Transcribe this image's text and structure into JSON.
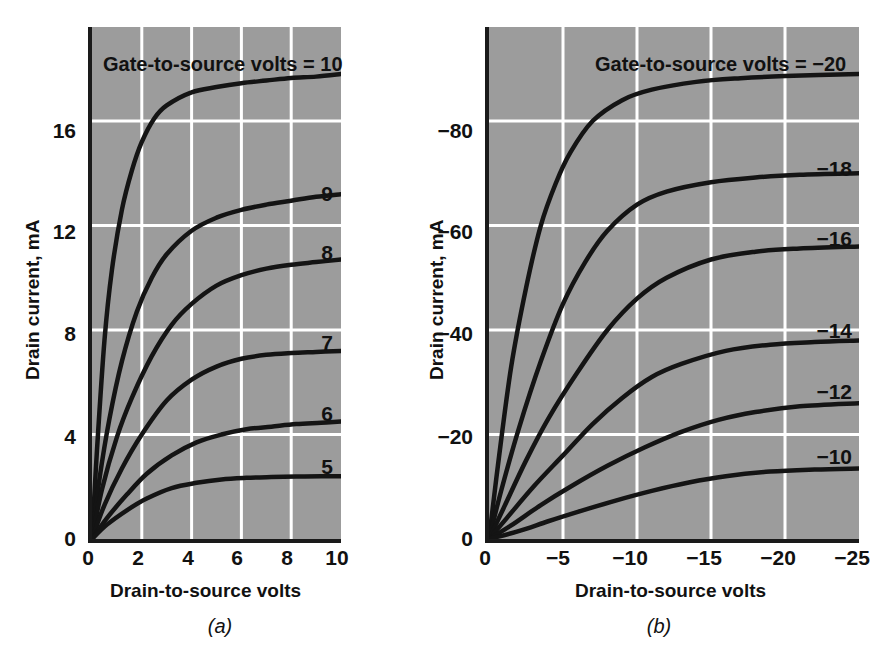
{
  "figure": {
    "background": "#ffffff",
    "plot_background": "#9c9c9c",
    "grid_color": "#ffffff",
    "curve_color": "#141414",
    "axis_color": "#1a1a1a"
  },
  "panel_a": {
    "caption": "(a)",
    "legend_title": "Gate-to-source volts = 10",
    "xlabel": "Drain-to-source volts",
    "ylabel": "Drain current, mA",
    "xticks": [
      "0",
      "2",
      "4",
      "6",
      "8",
      "10"
    ],
    "yticks": [
      "0",
      "4",
      "8",
      "12",
      "16"
    ],
    "curve_labels": [
      "9",
      "8",
      "7",
      "6",
      "5"
    ]
  },
  "panel_b": {
    "caption": "(b)",
    "legend_title": "Gate-to-source volts = −20",
    "xlabel": "Drain-to-source volts",
    "ylabel": "Drain current, mA",
    "xticks": [
      "0",
      "−5",
      "−10",
      "−15",
      "−20",
      "−25"
    ],
    "yticks": [
      "0",
      "−20",
      "−40",
      "−60",
      "−80"
    ],
    "curve_labels": [
      "−18",
      "−16",
      "−14",
      "−12",
      "−10"
    ]
  },
  "chart_data": [
    {
      "type": "line",
      "id": "panel-a",
      "title": "Gate-to-source volts = 10",
      "caption": "(a)",
      "xlabel": "Drain-to-source volts",
      "ylabel": "Drain current, mA",
      "xlim": [
        0,
        10
      ],
      "ylim": [
        0,
        19.6
      ],
      "xticks": [
        0,
        2,
        4,
        6,
        8,
        10
      ],
      "yticks": [
        0,
        4,
        8,
        12,
        16
      ],
      "grid": true,
      "legend_position": "inline-right-of-curve",
      "series": [
        {
          "name": "10",
          "saturation_current": 17.8,
          "knee_voltage": 2.2,
          "x": [
            0,
            0.2,
            0.5,
            0.8,
            1.2,
            1.6,
            2.0,
            2.5,
            3.0,
            4.0,
            5.0,
            6.0,
            7.0,
            8.0,
            9.0,
            10.0
          ],
          "y": [
            0,
            3.4,
            7.6,
            10.3,
            12.6,
            14.1,
            15.2,
            16.1,
            16.6,
            17.1,
            17.3,
            17.45,
            17.55,
            17.65,
            17.7,
            17.8
          ]
        },
        {
          "name": "9",
          "saturation_current": 13.2,
          "knee_voltage": 3.4,
          "x": [
            0,
            0.3,
            0.7,
            1.2,
            1.8,
            2.4,
            3.0,
            4.0,
            5.0,
            6.0,
            7.0,
            8.0,
            9.0,
            10.0
          ],
          "y": [
            0,
            2.3,
            4.6,
            6.8,
            8.7,
            10.0,
            10.9,
            11.8,
            12.3,
            12.6,
            12.8,
            12.95,
            13.1,
            13.2
          ]
        },
        {
          "name": "8",
          "saturation_current": 10.7,
          "knee_voltage": 4.0,
          "x": [
            0,
            0.4,
            1.0,
            1.6,
            2.4,
            3.2,
            4.0,
            5.0,
            6.0,
            7.0,
            8.0,
            9.0,
            10.0
          ],
          "y": [
            0,
            1.9,
            3.9,
            5.4,
            7.0,
            8.2,
            9.0,
            9.7,
            10.1,
            10.35,
            10.5,
            10.6,
            10.7
          ]
        },
        {
          "name": "7",
          "saturation_current": 7.2,
          "knee_voltage": 4.4,
          "x": [
            0,
            0.5,
            1.2,
            2.0,
            3.0,
            4.0,
            5.0,
            6.0,
            7.0,
            8.0,
            9.0,
            10.0
          ],
          "y": [
            0,
            1.3,
            2.7,
            4.0,
            5.3,
            6.1,
            6.6,
            6.9,
            7.05,
            7.12,
            7.16,
            7.2
          ]
        },
        {
          "name": "6",
          "saturation_current": 4.5,
          "knee_voltage": 5.0,
          "x": [
            0,
            0.6,
            1.4,
            2.2,
            3.2,
            4.2,
            5.2,
            6.2,
            7.2,
            8.2,
            9.2,
            10.0
          ],
          "y": [
            0,
            0.8,
            1.7,
            2.5,
            3.2,
            3.7,
            4.0,
            4.2,
            4.3,
            4.4,
            4.45,
            4.5
          ]
        },
        {
          "name": "5",
          "saturation_current": 2.4,
          "knee_voltage": 4.0,
          "x": [
            0,
            0.6,
            1.4,
            2.2,
            3.2,
            4.2,
            5.2,
            6.2,
            7.2,
            8.2,
            9.2,
            10.0
          ],
          "y": [
            0,
            0.55,
            1.1,
            1.55,
            1.95,
            2.15,
            2.28,
            2.34,
            2.37,
            2.39,
            2.4,
            2.4
          ]
        }
      ]
    },
    {
      "type": "line",
      "id": "panel-b",
      "title": "Gate-to-source volts = −20",
      "caption": "(b)",
      "xlabel": "Drain-to-source volts",
      "ylabel": "Drain current, mA",
      "xlim": [
        0,
        -25
      ],
      "ylim": [
        0,
        -98
      ],
      "xticks": [
        0,
        -5,
        -10,
        -15,
        -20,
        -25
      ],
      "yticks": [
        0,
        -20,
        -40,
        -60,
        -80
      ],
      "grid": true,
      "legend_position": "inline-right-of-curve",
      "series": [
        {
          "name": "−20",
          "saturation_current": -89,
          "knee_voltage": -7,
          "x": [
            0,
            -0.6,
            -1.5,
            -2.5,
            -3.5,
            -4.5,
            -5.5,
            -7.0,
            -9.0,
            -11.0,
            -14.0,
            -17.0,
            -20.0,
            -25.0
          ],
          "y": [
            0,
            -14,
            -33,
            -48,
            -60,
            -68,
            -74,
            -80,
            -84,
            -86,
            -87.5,
            -88.2,
            -88.6,
            -89
          ]
        },
        {
          "name": "−18",
          "saturation_current": -70,
          "knee_voltage": -9,
          "x": [
            0,
            -0.8,
            -2.0,
            -3.5,
            -5.0,
            -6.5,
            -8.0,
            -10.0,
            -12.0,
            -15.0,
            -18.0,
            -21.0,
            -25.0
          ],
          "y": [
            0,
            -9,
            -21,
            -34,
            -45,
            -53,
            -59,
            -64,
            -66.5,
            -68.3,
            -69.2,
            -69.7,
            -70
          ]
        },
        {
          "name": "−16",
          "saturation_current": -56,
          "knee_voltage": -11,
          "x": [
            0,
            -1.0,
            -2.5,
            -4.0,
            -6.0,
            -8.0,
            -10.0,
            -12.0,
            -15.0,
            -18.0,
            -21.0,
            -25.0
          ],
          "y": [
            0,
            -6,
            -15,
            -23,
            -32,
            -40,
            -46,
            -50,
            -53.5,
            -55,
            -55.6,
            -56
          ]
        },
        {
          "name": "−14",
          "saturation_current": -38,
          "knee_voltage": -12,
          "x": [
            0,
            -1.2,
            -3.0,
            -5.0,
            -7.0,
            -9.0,
            -11.0,
            -13.0,
            -16.0,
            -19.0,
            -22.0,
            -25.0
          ],
          "y": [
            0,
            -4,
            -10,
            -16,
            -22,
            -27,
            -31,
            -33.5,
            -36,
            -37.2,
            -37.7,
            -38
          ]
        },
        {
          "name": "−12",
          "saturation_current": -26,
          "knee_voltage": -12,
          "x": [
            0,
            -1.5,
            -3.5,
            -5.5,
            -8.0,
            -10.5,
            -13.0,
            -15.5,
            -18.0,
            -21.0,
            -25.0
          ],
          "y": [
            0,
            -2.6,
            -6.5,
            -10,
            -14,
            -17.5,
            -20.5,
            -22.8,
            -24.3,
            -25.4,
            -26
          ]
        },
        {
          "name": "−10",
          "saturation_current": -13.5,
          "knee_voltage": -12,
          "x": [
            0,
            -2.0,
            -4.0,
            -6.0,
            -8.5,
            -11.0,
            -13.5,
            -16.0,
            -19.0,
            -22.0,
            -25.0
          ],
          "y": [
            0,
            -1.5,
            -3.4,
            -5.2,
            -7.3,
            -9.2,
            -10.8,
            -12.0,
            -12.9,
            -13.3,
            -13.5
          ]
        }
      ]
    }
  ]
}
